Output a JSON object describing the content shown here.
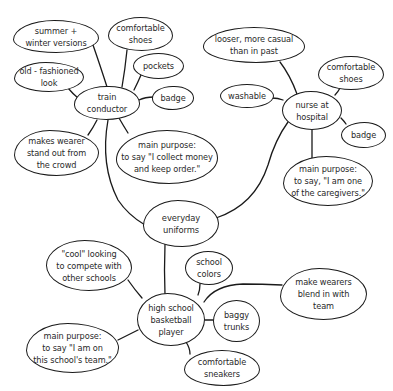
{
  "diagram": {
    "type": "mind-map",
    "center": {
      "id": "center",
      "label": "everyday\nuniforms"
    },
    "branches": [
      {
        "id": "train",
        "label": "train\nconductor",
        "children": [
          {
            "id": "t1",
            "label": "summer +\nwinter versions"
          },
          {
            "id": "t2",
            "label": "comfortable\nshoes"
          },
          {
            "id": "t3",
            "label": "pockets"
          },
          {
            "id": "t4",
            "label": "badge"
          },
          {
            "id": "t5",
            "label": "old - fashioned\nlook"
          },
          {
            "id": "t6",
            "label": "makes wearer\nstand out from\nthe crowd"
          },
          {
            "id": "t7",
            "label": "main purpose:\nto say \"I collect money\nand keep order.\""
          }
        ]
      },
      {
        "id": "nurse",
        "label": "nurse at\nhospital",
        "children": [
          {
            "id": "n1",
            "label": "looser, more casual\nthan in past"
          },
          {
            "id": "n2",
            "label": "comfortable\nshoes"
          },
          {
            "id": "n3",
            "label": "washable"
          },
          {
            "id": "n4",
            "label": "badge"
          },
          {
            "id": "n5",
            "label": "main purpose:\nto say, \"I am one\nof the caregivers.\""
          }
        ]
      },
      {
        "id": "player",
        "label": "high school\nbasketball\nplayer",
        "children": [
          {
            "id": "p1",
            "label": "\"cool\" looking\nto compete with\nother schools"
          },
          {
            "id": "p2",
            "label": "school\ncolors"
          },
          {
            "id": "p3",
            "label": "make wearers\nblend in with\nteam"
          },
          {
            "id": "p4",
            "label": "baggy\ntrunks"
          },
          {
            "id": "p5",
            "label": "main purpose:\nto say \"I am on\nthis school's team.\""
          },
          {
            "id": "p6",
            "label": "comfortable\nsneakers"
          }
        ]
      }
    ]
  },
  "labels": {
    "center": "everyday\nuniforms",
    "train": "train\nconductor",
    "t1": "summer +\nwinter versions",
    "t2": "comfortable\nshoes",
    "t3": "pockets",
    "t4": "badge",
    "t5": "old - fashioned\nlook",
    "t6": "makes wearer\nstand out from\nthe crowd",
    "t7": "main purpose:\nto say \"I collect money\nand keep order.\"",
    "nurse": "nurse at\nhospital",
    "n1": "looser, more casual\nthan in past",
    "n2": "comfortable\nshoes",
    "n3": "washable",
    "n4": "badge",
    "n5": "main purpose:\nto say, \"I am one\nof the caregivers.\"",
    "player": "high school\nbasketball\nplayer",
    "p1": "\"cool\" looking\nto compete with\nother schools",
    "p2": "school\ncolors",
    "p3": "make wearers\nblend in with\nteam",
    "p4": "baggy\ntrunks",
    "p5": "main purpose:\nto say \"I am on\nthis school's team.\"",
    "p6": "comfortable\nsneakers"
  },
  "colors": {
    "stroke": "#1a1a1a",
    "text": "#2a2a2a",
    "background": "#ffffff"
  }
}
